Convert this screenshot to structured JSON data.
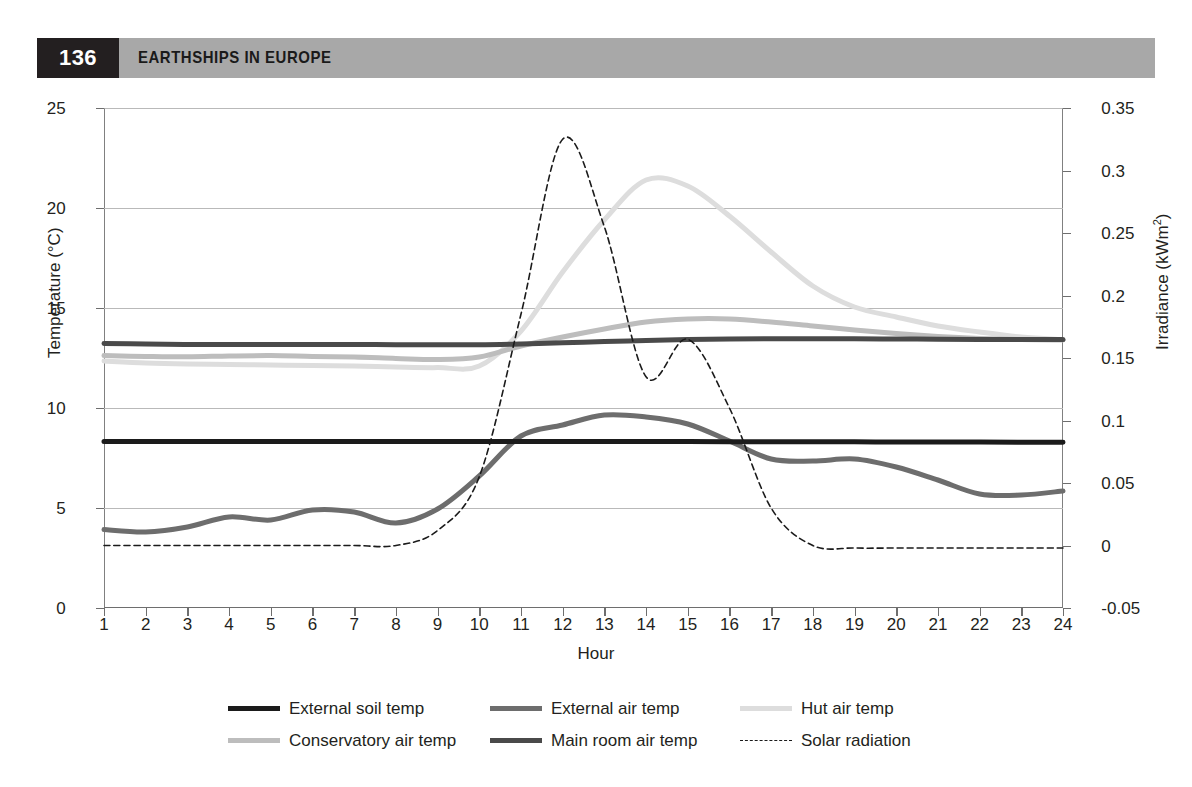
{
  "header": {
    "page_number": "136",
    "running_head": "EARTHSHIPS IN EUROPE"
  },
  "chart_data": {
    "type": "line",
    "title": "",
    "xlabel": "Hour",
    "ylabel": "Temperature (°C)",
    "y2label": "Irradiance (kWm²)",
    "x": [
      1,
      2,
      3,
      4,
      5,
      6,
      7,
      8,
      9,
      10,
      11,
      12,
      13,
      14,
      15,
      16,
      17,
      18,
      19,
      20,
      21,
      22,
      23,
      24
    ],
    "xlim": [
      1,
      24
    ],
    "xticks": [
      "1",
      "2",
      "3",
      "4",
      "5",
      "6",
      "7",
      "8",
      "9",
      "10",
      "11",
      "12",
      "13",
      "14",
      "15",
      "16",
      "17",
      "18",
      "19",
      "20",
      "21",
      "22",
      "23",
      "24"
    ],
    "ylim": [
      0,
      25
    ],
    "yticks": [
      "0",
      "5",
      "10",
      "15",
      "20",
      "25"
    ],
    "y2lim": [
      -0.05,
      0.35
    ],
    "y2ticks": [
      "-0.05",
      "0",
      "0.05",
      "0.1",
      "0.15",
      "0.2",
      "0.25",
      "0.3",
      "0.35"
    ],
    "grid": true,
    "legend_position": "below",
    "series": [
      {
        "name": "External soil temp",
        "axis": "left",
        "color": "#1b1b1b",
        "width": 5,
        "style": "solid",
        "values": [
          8.33,
          8.33,
          8.32,
          8.32,
          8.32,
          8.32,
          8.32,
          8.32,
          8.32,
          8.32,
          8.32,
          8.32,
          8.32,
          8.32,
          8.32,
          8.31,
          8.31,
          8.31,
          8.31,
          8.3,
          8.3,
          8.3,
          8.29,
          8.29
        ]
      },
      {
        "name": "External air temp",
        "axis": "left",
        "color": "#6d6d6d",
        "width": 5,
        "style": "solid",
        "values": [
          3.92,
          3.8,
          4.05,
          4.55,
          4.4,
          4.9,
          4.8,
          4.25,
          4.95,
          6.6,
          8.6,
          9.15,
          9.65,
          9.55,
          9.2,
          8.35,
          7.45,
          7.35,
          7.45,
          7.05,
          6.4,
          5.7,
          5.65,
          5.85
        ]
      },
      {
        "name": "Hut air temp",
        "axis": "left",
        "color": "#dddddd",
        "width": 5,
        "style": "solid",
        "values": [
          12.35,
          12.25,
          12.2,
          12.18,
          12.15,
          12.12,
          12.1,
          12.05,
          12.02,
          12.1,
          13.85,
          16.8,
          19.4,
          21.4,
          21.1,
          19.6,
          17.8,
          16.1,
          15.05,
          14.55,
          14.1,
          13.8,
          13.55,
          13.42
        ]
      },
      {
        "name": "Conservatory air temp",
        "axis": "left",
        "color": "#bdbdbd",
        "width": 5,
        "style": "solid",
        "values": [
          12.62,
          12.58,
          12.56,
          12.6,
          12.62,
          12.58,
          12.55,
          12.48,
          12.42,
          12.55,
          13.1,
          13.55,
          13.95,
          14.3,
          14.45,
          14.45,
          14.3,
          14.1,
          13.9,
          13.72,
          13.58,
          13.48,
          13.42,
          13.4
        ]
      },
      {
        "name": "Main room air temp",
        "axis": "left",
        "color": "#4a4a4a",
        "width": 5,
        "style": "solid",
        "values": [
          13.22,
          13.2,
          13.18,
          13.18,
          13.18,
          13.18,
          13.18,
          13.16,
          13.16,
          13.16,
          13.2,
          13.26,
          13.32,
          13.38,
          13.42,
          13.45,
          13.46,
          13.46,
          13.46,
          13.45,
          13.44,
          13.43,
          13.42,
          13.42
        ]
      },
      {
        "name": "Solar radiation",
        "axis": "right",
        "color": "#1b1b1b",
        "width": 1.6,
        "style": "dashed",
        "values": [
          0.0,
          0.0,
          0.0,
          0.0,
          0.0,
          0.0,
          0.0,
          0.0,
          0.012,
          0.055,
          0.185,
          0.325,
          0.255,
          0.135,
          0.165,
          0.11,
          0.03,
          0.0,
          -0.002,
          -0.002,
          -0.002,
          -0.002,
          -0.002,
          -0.002
        ]
      }
    ]
  },
  "legend": {
    "rows": [
      [
        {
          "label": "External soil temp",
          "color": "#1b1b1b",
          "style": "solid",
          "width": 5
        },
        {
          "label": "External air temp",
          "color": "#6d6d6d",
          "style": "solid",
          "width": 5
        },
        {
          "label": "Hut air temp",
          "color": "#dddddd",
          "style": "solid",
          "width": 5
        }
      ],
      [
        {
          "label": "Conservatory air temp",
          "color": "#bdbdbd",
          "style": "solid",
          "width": 5
        },
        {
          "label": "Main room air temp",
          "color": "#4a4a4a",
          "style": "solid",
          "width": 5
        },
        {
          "label": "Solar radiation",
          "color": "#1b1b1b",
          "style": "dashed",
          "width": 1.6
        }
      ]
    ]
  }
}
